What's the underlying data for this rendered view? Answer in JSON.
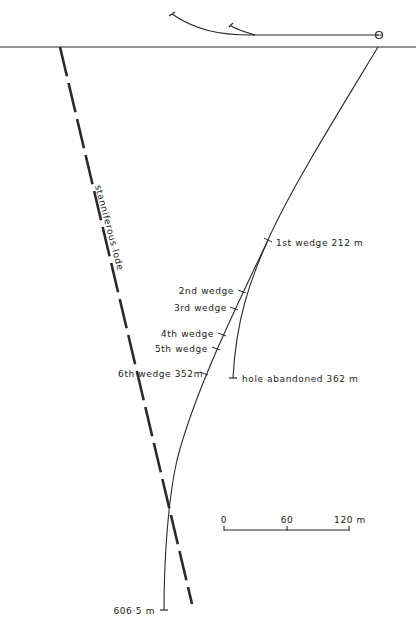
{
  "diagram": {
    "type": "drill-hole-section",
    "colors": {
      "ink": "#2a2a2a",
      "background": "#ffffff"
    },
    "surface_line": {
      "label": ""
    },
    "lode": {
      "label": "stanniferous lode"
    },
    "wedges": [
      {
        "label": "1st wedge 212 m"
      },
      {
        "label": "2nd wedge"
      },
      {
        "label": "3rd wedge"
      },
      {
        "label": "4th wedge"
      },
      {
        "label": "5th wedge"
      },
      {
        "label": "6th wedge 352m"
      }
    ],
    "abandoned_hole": {
      "label": "hole abandoned 362 m"
    },
    "final_depth": {
      "label": "606·5 m"
    },
    "scale_bar": {
      "ticks": [
        "0",
        "60",
        "120 m"
      ]
    }
  }
}
